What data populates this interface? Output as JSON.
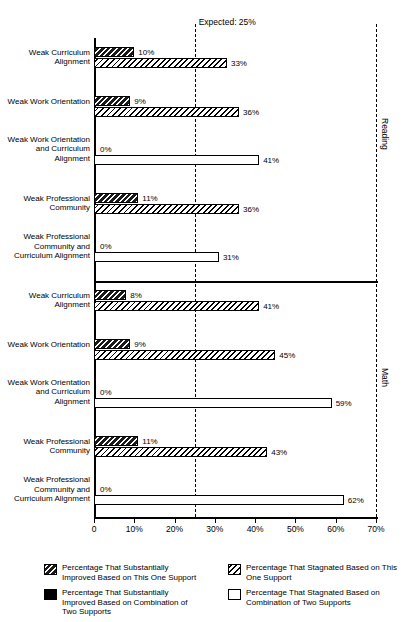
{
  "chart_data": {
    "type": "bar",
    "orientation": "horizontal",
    "title": "",
    "xlabel": "",
    "ylabel": "",
    "xlim": [
      0,
      70
    ],
    "xticks": [
      0,
      10,
      20,
      30,
      40,
      50,
      60,
      70
    ],
    "xticklabels": [
      "0",
      "10%",
      "20%",
      "30%",
      "40%",
      "50%",
      "60%",
      "70%"
    ],
    "grid": false,
    "expected_line": {
      "value": 25,
      "label": "Expected: 25%"
    },
    "panels": [
      {
        "name": "Reading",
        "groups": [
          {
            "label": "Weak Curriculum Alignment",
            "support_type": "one",
            "improved": 10,
            "improved_label": "10%",
            "stagnated": 33,
            "stagnated_label": "33%"
          },
          {
            "label": "Weak Work Orientation",
            "support_type": "one",
            "improved": 9,
            "improved_label": "9%",
            "stagnated": 36,
            "stagnated_label": "36%"
          },
          {
            "label": "Weak Work Orientation and Curriculum Alignment",
            "support_type": "two",
            "improved": 0,
            "improved_label": "0%",
            "stagnated": 41,
            "stagnated_label": "41%"
          },
          {
            "label": "Weak Professional Community",
            "support_type": "one",
            "improved": 11,
            "improved_label": "11%",
            "stagnated": 36,
            "stagnated_label": "36%"
          },
          {
            "label": "Weak Professional Community and Curriculum Alignment",
            "support_type": "two",
            "improved": 0,
            "improved_label": "0%",
            "stagnated": 31,
            "stagnated_label": "31%"
          }
        ]
      },
      {
        "name": "Math",
        "groups": [
          {
            "label": "Weak Curriculum Alignment",
            "support_type": "one",
            "improved": 8,
            "improved_label": "8%",
            "stagnated": 41,
            "stagnated_label": "41%"
          },
          {
            "label": "Weak Work Orientation",
            "support_type": "one",
            "improved": 9,
            "improved_label": "9%",
            "stagnated": 45,
            "stagnated_label": "45%"
          },
          {
            "label": "Weak Work Orientation and Curriculum Alignment",
            "support_type": "two",
            "improved": 0,
            "improved_label": "0%",
            "stagnated": 59,
            "stagnated_label": "59%"
          },
          {
            "label": "Weak Professional Community",
            "support_type": "one",
            "improved": 11,
            "improved_label": "11%",
            "stagnated": 43,
            "stagnated_label": "43%"
          },
          {
            "label": "Weak Professional Community and Curriculum Alignment",
            "support_type": "two",
            "improved": 0,
            "improved_label": "0%",
            "stagnated": 62,
            "stagnated_label": "62%"
          }
        ]
      }
    ],
    "legend": {
      "position": "bottom",
      "entries": [
        {
          "swatch": "hatch-dark",
          "label": "Percentage That Substantially Improved Based on This One Support"
        },
        {
          "swatch": "hatch-light",
          "label": "Percentage That Stagnated Based on This One Support"
        },
        {
          "swatch": "solid",
          "label": "Percentage That Substantially Improved Based on Combination of Two Supports"
        },
        {
          "swatch": "open",
          "label": "Percentage That Stagnated Based on Combination of Two Supports"
        }
      ]
    },
    "colors": {
      "ink": "#000000",
      "paper": "#ffffff"
    }
  }
}
